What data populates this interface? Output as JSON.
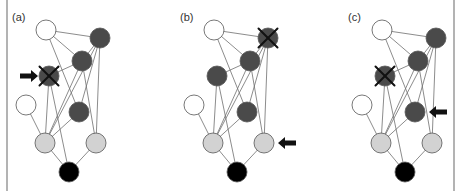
{
  "figure": {
    "width": 458,
    "height": 191,
    "panel_offset_x": 168,
    "colors": {
      "white": "#ffffff",
      "dark": "#4a4a4a",
      "light": "#d2d2d2",
      "black": "#000000",
      "edge": "#6e6e6e",
      "border": "#9a9a9a"
    },
    "node_radius": 10,
    "nodes": [
      {
        "id": "top-white",
        "x": 46,
        "y": 30,
        "fill": "white"
      },
      {
        "id": "top-right-dark",
        "x": 100,
        "y": 38,
        "fill": "dark"
      },
      {
        "id": "mid-dark",
        "x": 82,
        "y": 61,
        "fill": "dark"
      },
      {
        "id": "left-dark",
        "x": 49,
        "y": 76,
        "fill": "dark"
      },
      {
        "id": "left-white",
        "x": 26,
        "y": 105,
        "fill": "white"
      },
      {
        "id": "lower-dark",
        "x": 79,
        "y": 112,
        "fill": "dark"
      },
      {
        "id": "bottom-left-light",
        "x": 45,
        "y": 143,
        "fill": "light"
      },
      {
        "id": "bottom-right-light",
        "x": 96,
        "y": 143,
        "fill": "light"
      },
      {
        "id": "output-black",
        "x": 69,
        "y": 172,
        "fill": "black"
      }
    ],
    "edges": [
      [
        "top-white",
        "top-right-dark"
      ],
      [
        "top-white",
        "mid-dark"
      ],
      [
        "top-white",
        "lower-dark"
      ],
      [
        "top-right-dark",
        "mid-dark"
      ],
      [
        "top-right-dark",
        "bottom-left-light"
      ],
      [
        "top-right-dark",
        "bottom-right-light"
      ],
      [
        "top-right-dark",
        "lower-dark"
      ],
      [
        "mid-dark",
        "left-dark"
      ],
      [
        "mid-dark",
        "bottom-left-light"
      ],
      [
        "mid-dark",
        "bottom-right-light"
      ],
      [
        "left-dark",
        "bottom-left-light"
      ],
      [
        "left-dark",
        "output-black"
      ],
      [
        "left-white",
        "bottom-left-light"
      ],
      [
        "lower-dark",
        "bottom-left-light"
      ],
      [
        "bottom-left-light",
        "output-black"
      ],
      [
        "bottom-right-light",
        "output-black"
      ]
    ],
    "panels": [
      {
        "label": "(a)",
        "label_pos": [
          12,
          21
        ],
        "crossed_node": "left-dark",
        "arrow": {
          "direction": "right",
          "tip_x": 38,
          "y": 76
        }
      },
      {
        "label": "(b)",
        "label_pos": [
          12,
          21
        ],
        "crossed_node": "top-right-dark",
        "arrow": {
          "direction": "left",
          "tip_x": 110,
          "y": 143
        }
      },
      {
        "label": "(c)",
        "label_pos": [
          12,
          21
        ],
        "crossed_node": "left-dark",
        "arrow": {
          "direction": "left",
          "tip_x": 93,
          "y": 112
        }
      }
    ],
    "borders": [
      {
        "x": 7,
        "y1": 0,
        "y2": 191
      },
      {
        "x": 454,
        "y1": 0,
        "y2": 191
      }
    ]
  }
}
